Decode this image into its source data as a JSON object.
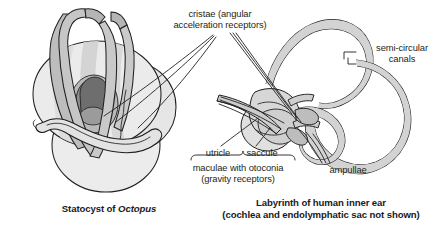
{
  "figure": {
    "background_color": "#ffffff",
    "ink_color": "#231f20",
    "tube_fill": "#cfcfcf",
    "tube_fill_light": "#dcdcdc",
    "organ_fill": "#e8e8e8",
    "organ_fill_mid": "#c8c8c8",
    "organ_fill_dark": "#8f8f8f",
    "organ_fill_darkest": "#6f6f6f"
  },
  "labels": {
    "cristae": "cristae (angular\nacceleration receptors)",
    "semicircular_canals": "semi-circular\ncanals",
    "utricle": "utricle",
    "saccule": "saccule",
    "maculae": "maculae with otoconia\n(gravity receptors)",
    "ampullae": "ampullae"
  },
  "captions": {
    "left_prefix": "Statocyst of ",
    "left_italic": "Octopus",
    "right_line1": "Labyrinth of human inner ear",
    "right_line2": "(cochlea and endolymphatic sac not shown)"
  },
  "panels": [
    {
      "id": "left",
      "name": "octopus-statocyst-diagram",
      "caption": "Statocyst of Octopus",
      "parts": [
        "upper sphere",
        "lower sphere",
        "crista ridges",
        "macula",
        "statolith",
        "sac tubes"
      ]
    },
    {
      "id": "right",
      "name": "human-labyrinth-diagram",
      "caption": "Labyrinth of human inner ear (cochlea and endolymphatic sac not shown)",
      "parts": [
        "anterior semicircular canal",
        "posterior semicircular canal",
        "lateral semicircular canal",
        "utricle",
        "saccule",
        "ampullae",
        "vestibular nerve branches"
      ]
    }
  ]
}
